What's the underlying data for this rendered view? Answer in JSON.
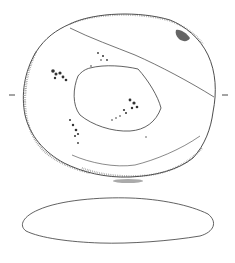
{
  "figure": {
    "type": "archaeological-illustration",
    "views": [
      {
        "name": "plan-view",
        "shape": "rounded oval with central depression"
      },
      {
        "name": "profile-view",
        "shape": "flat ellipse section"
      }
    ],
    "section_marks": [
      "-",
      "-"
    ],
    "colors": {
      "line": "#3a3a3a",
      "stipple": "#6a6a6a",
      "background": "#ffffff"
    }
  }
}
